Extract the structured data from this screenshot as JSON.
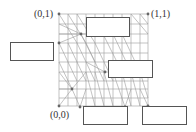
{
  "diagram": {
    "type": "triangulated-mesh-unit-square",
    "colors": {
      "mesh_edge": "#9a9a9a",
      "mesh_node": "#666666",
      "box_stroke": "#555555",
      "label_text": "#333333",
      "background": "#ffffff"
    },
    "corner_labels": {
      "top_left": "(0,1)",
      "top_right": "(1,1)",
      "bottom_left": "(0,0)"
    },
    "boxes": [
      {
        "id": "left",
        "label": ""
      },
      {
        "id": "top-inner",
        "label": ""
      },
      {
        "id": "right-middle",
        "label": ""
      },
      {
        "id": "bottom-middle",
        "label": ""
      },
      {
        "id": "bottom-right",
        "label": ""
      }
    ]
  }
}
